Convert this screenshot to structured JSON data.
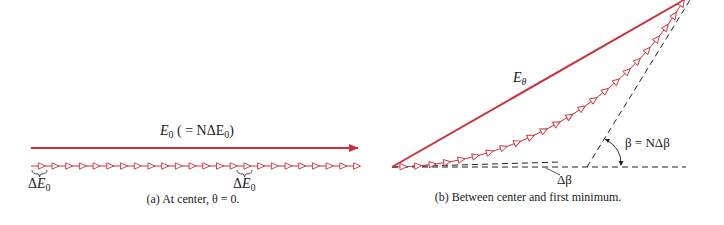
{
  "colors": {
    "vector": "#c8323c",
    "phasor": "#c8323c",
    "dashed": "#222222",
    "text": "#222222"
  },
  "panel_a": {
    "resultant_label": {
      "symbol": "E",
      "sub": "0",
      "rest": " ( = NΔE",
      "sub2": "0",
      "close": ")"
    },
    "segment_label_left": {
      "prefix": "Δ",
      "symbol": "E",
      "sub": "0"
    },
    "segment_label_mid": {
      "prefix": "Δ",
      "symbol": "E",
      "sub": "0"
    },
    "caption": "(a) At center, θ = 0.",
    "segments": 24
  },
  "panel_b": {
    "resultant_label": {
      "symbol": "E",
      "sub": "θ"
    },
    "angle_label": "β = NΔβ",
    "small_angle_label": "Δβ",
    "caption": "(b) Between center and first minimum.",
    "segments": 24
  }
}
